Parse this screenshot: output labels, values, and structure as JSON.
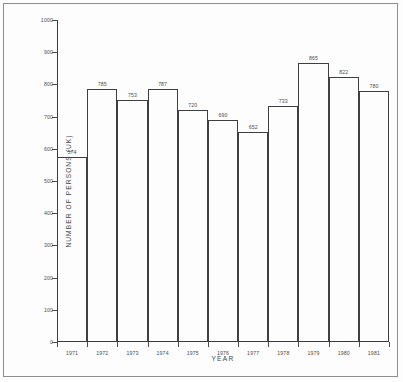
{
  "chart_data": {
    "type": "bar",
    "title": "",
    "xlabel": "YEAR",
    "ylabel": "NUMBER OF PERSONS (UK)",
    "categories": [
      "1971",
      "1972",
      "1973",
      "1974",
      "1975",
      "1976",
      "1977",
      "1978",
      "1979",
      "1980",
      "1981"
    ],
    "values": [
      574,
      785,
      753,
      787,
      720,
      690,
      652,
      733,
      865,
      822,
      780
    ],
    "value_labels": [
      "574",
      "785",
      "753",
      "787",
      "720",
      "690",
      "652",
      "733",
      "865",
      "822",
      "780"
    ],
    "ylim": [
      0,
      1000
    ],
    "ytick_labels": [
      "0",
      "100",
      "200",
      "300",
      "400",
      "500",
      "600",
      "700",
      "800",
      "900",
      "1000"
    ],
    "ytick_values": [
      0,
      100,
      200,
      300,
      400,
      500,
      600,
      700,
      800,
      900,
      1000
    ],
    "grid": false,
    "legend": null,
    "bar_style": "outline",
    "colors": {
      "line": "#3f3f3f",
      "text": "#4b4b4b",
      "background": "#fdfdfd",
      "frame": "#8d8d8d"
    }
  }
}
